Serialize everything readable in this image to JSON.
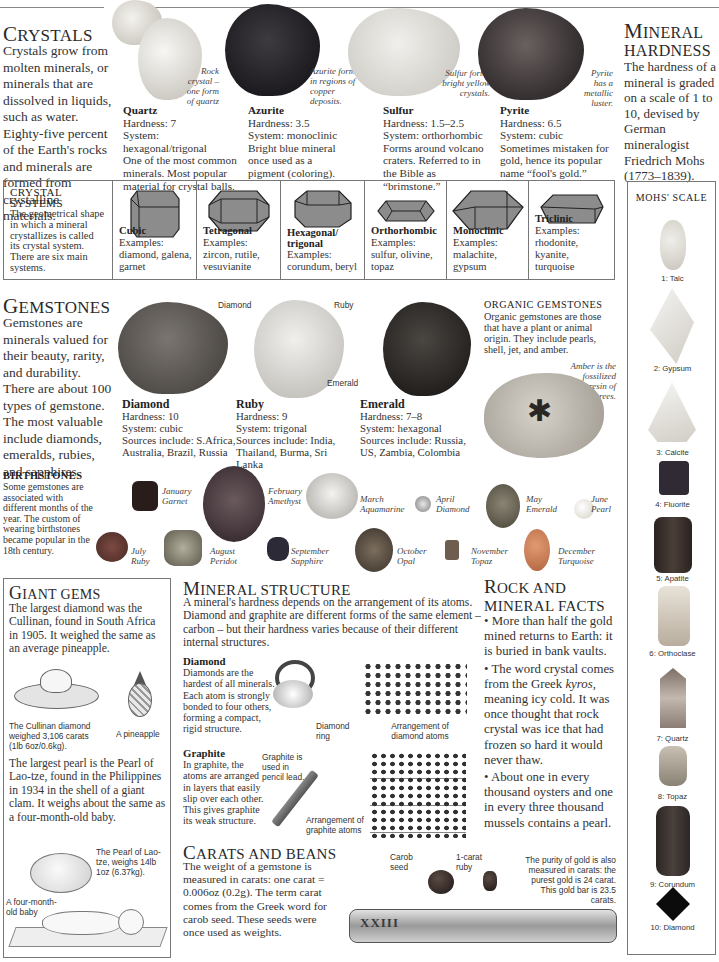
{
  "crystals": {
    "title_cap": "C",
    "title_rest": "RYSTALS",
    "intro": "Crystals grow from molten minerals, or minerals that are dissolved in liquids, such as water. Eighty-five percent of the Earth's rocks and minerals are formed from crystalline materials.",
    "specimens": [
      {
        "name": "Quartz",
        "hardness": "Hardness: 7",
        "system": "System: hexagonal/trigonal",
        "desc": "One of the most common minerals. Most popular material for crystal balls.",
        "caption": "Rock crystal – one form of quartz"
      },
      {
        "name": "Azurite",
        "hardness": "Hardness: 3.5",
        "system": "System: monoclinic",
        "desc": "Bright blue mineral once used as a pigment (coloring).",
        "caption": "Azurite forms in regions of copper deposits."
      },
      {
        "name": "Sulfur",
        "hardness": "Hardness: 1.5–2.5",
        "system": "System: orthorhombic",
        "desc": "Forms around volcano craters. Referred to in the Bible as “brimstone.”",
        "caption": "Sulfur forms bright yellow crystals."
      },
      {
        "name": "Pyrite",
        "hardness": "Hardness: 6.5",
        "system": "System: cubic",
        "desc": "Sometimes mistaken for gold, hence its popular name “fool's gold.”",
        "caption": "Pyrite has a metallic luster."
      }
    ]
  },
  "mineral_hardness": {
    "title_cap": "M",
    "title_rest": "INERAL",
    "title_line2": "HARDNESS",
    "text": "The hardness of a mineral is graded on a scale of 1 to 10, devised by German mineralogist Friedrich Mohs (1773–1839).",
    "scale_title": "MOHS' SCALE",
    "scale": [
      {
        "label": "1: Talc",
        "color": "#d9d6cf"
      },
      {
        "label": "2: Gypsum",
        "color": "#e6e3dd"
      },
      {
        "label": "3: Calcite",
        "color": "#ece9e2"
      },
      {
        "label": "4: Fluorite",
        "color": "#2f2a33"
      },
      {
        "label": "5: Apatite",
        "color": "#3a302c"
      },
      {
        "label": "6: Orthoclase",
        "color": "#cfc5b6"
      },
      {
        "label": "7: Quartz",
        "color": "#9a8c82"
      },
      {
        "label": "8: Topaz",
        "color": "#a49c8a"
      },
      {
        "label": "9: Corundum",
        "color": "#3c3432"
      },
      {
        "label": "10: Diamond",
        "color": "#111111"
      }
    ]
  },
  "crystal_systems": {
    "title_line1": "CRYSTAL",
    "title_line2": "SYSTEMS",
    "text": "The geometrical shape in which a mineral crystallizes is called its crystal system. There are six main systems.",
    "systems": [
      {
        "name": "Cubic",
        "examples_label": "Examples:",
        "examples": "diamond, galena, garnet"
      },
      {
        "name": "Tetragonal",
        "examples_label": "Examples:",
        "examples": "zircon, rutile, vesuvianite"
      },
      {
        "name": "Hexagonal/ trigonal",
        "examples_label": "Examples:",
        "examples": "corundum, beryl"
      },
      {
        "name": "Orthorhombic",
        "examples_label": "Examples:",
        "examples": "sulfur, olivine, topaz"
      },
      {
        "name": "Monoclinic",
        "examples_label": "Examples:",
        "examples": "malachite, gypsum"
      },
      {
        "name": "Triclinic",
        "examples_label": "Examples:",
        "examples": "rhodonite, kyanite, turquoise"
      }
    ]
  },
  "gemstones": {
    "title_cap": "G",
    "title_rest": "EMSTONES",
    "intro": "Gemstones are minerals valued for their beauty, rarity, and durability. There are about 100 types of gemstone. The most valuable include diamonds, emeralds, rubies, and sapphires.",
    "specimens": [
      {
        "name": "Diamond",
        "hardness": "Hardness: 10",
        "system": "System: cubic",
        "sources": "Sources include: S.Africa, Australia, Brazil, Russia",
        "pointer": "Diamond"
      },
      {
        "name": "Ruby",
        "hardness": "Hardness: 9",
        "system": "System: trigonal",
        "sources": "Sources include: India, Thailand, Burma, Sri Lanka",
        "pointer": "Ruby"
      },
      {
        "name": "Emerald",
        "hardness": "Hardness: 7–8",
        "system": "System: hexagonal",
        "sources": "Sources include: Russia, US, Zambia, Colombia",
        "pointer": "Emerald"
      }
    ],
    "organic": {
      "title": "ORGANIC GEMSTONES",
      "text": "Organic gemstones are those that have a plant or animal origin. They include pearls, shell, jet, and amber.",
      "caption": "Amber is the fossilized resin of trees."
    }
  },
  "birthstones": {
    "title": "BIRTHSTONES",
    "text": "Some gemstones are associated with different months of the year. The custom of wearing birthstones became popular in the 18th century.",
    "months": [
      {
        "month": "January",
        "stone": "Garnet",
        "color": "#2a1c1a"
      },
      {
        "month": "February",
        "stone": "Amethyst",
        "color": "#4a3a3e"
      },
      {
        "month": "March",
        "stone": "Aquamarine",
        "color": "#d8d6d2"
      },
      {
        "month": "April",
        "stone": "Diamond",
        "color": "#bdbdbd"
      },
      {
        "month": "May",
        "stone": "Emerald",
        "color": "#5e5a4c"
      },
      {
        "month": "June",
        "stone": "Pearl",
        "color": "#ece8e0"
      },
      {
        "month": "July",
        "stone": "Ruby",
        "color": "#5a3630"
      },
      {
        "month": "August",
        "stone": "Peridot",
        "color": "#8a8676"
      },
      {
        "month": "September",
        "stone": "Sapphire",
        "color": "#2c2a36"
      },
      {
        "month": "October",
        "stone": "Opal",
        "color": "#5c5044"
      },
      {
        "month": "November",
        "stone": "Topaz",
        "color": "#6e5e50"
      },
      {
        "month": "December",
        "stone": "Turquoise",
        "color": "#c77a52"
      }
    ]
  },
  "giant_gems": {
    "title_cap": "G",
    "title_rest": "IANT GEMS",
    "text1": "The largest diamond was the Cullinan, found in South Africa in 1905. It weighed the same as an average pineapple.",
    "cullinan_caption": "The Cullinan diamond weighed 3,106 carats (1lb 6oz/0.6kg).",
    "pineapple_caption": "A pineapple",
    "text2": "The largest pearl is the Pearl of Lao-tze, found in the Philippines in 1934 in the shell of a giant clam. It weighs about the same as a four-month-old baby.",
    "pearl_caption": "The Pearl of Lao-tze, weighs 14lb 1oz (6.37kg).",
    "baby_caption": "A four-month-old baby"
  },
  "mineral_structure": {
    "title_cap": "M",
    "title_rest": "INERAL STRUCTURE",
    "intro": "A mineral's hardness depends on the arrangement of its atoms. Diamond and graphite are different forms of the same element – carbon – but their hardness varies because of their different internal structures.",
    "diamond": {
      "title": "Diamond",
      "text": "Diamonds are the hardest of all minerals. Each atom is strongly bonded to four others, forming a compact, rigid structure.",
      "ring_caption": "Diamond ring",
      "atoms_caption": "Arrangement of diamond atoms"
    },
    "graphite": {
      "title": "Graphite",
      "text": "In graphite, the atoms are arranged in layers that easily slip over each other. This gives graphite its weak structure.",
      "pencil_caption": "Graphite is used in pencil lead.",
      "atoms_caption": "Arrangement of graphite atoms"
    }
  },
  "carats": {
    "title_cap": "C",
    "title_rest": "ARATS AND BEANS",
    "text": "The weight of a gemstone is measured in carats: one carat = 0.006oz (0.2g). The term carat comes from the Greek word for carob seed. These seeds were once used as weights.",
    "carob_caption": "Carob seed",
    "ruby_caption": "1-carat ruby",
    "gold_caption": "The purity of gold is also measured in carats: the purest gold is 24 carat. This gold bar is 23.5 carats.",
    "bar_marking": "XXIII"
  },
  "facts": {
    "title_cap": "R",
    "title_rest": "OCK AND",
    "title_line2": "MINERAL FACTS",
    "items": [
      {
        "pre": "More than half the gold mined returns to Earth: it is buried in bank vaults.",
        "em": "",
        "post": ""
      },
      {
        "pre": "The word crystal comes from the Greek ",
        "em": "kyros",
        "post": ", meaning icy cold. It was once thought that rock crystal was ice that had frozen so hard it would never thaw."
      },
      {
        "pre": "About one in every thousand oysters and one in every three thousand mussels contains a pearl.",
        "em": "",
        "post": ""
      }
    ]
  }
}
